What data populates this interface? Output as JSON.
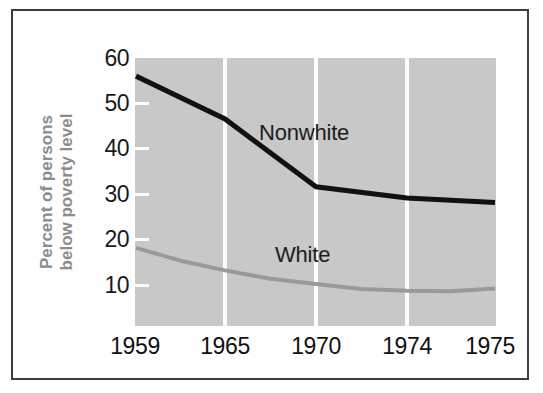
{
  "chart_data": {
    "type": "line",
    "title": "",
    "subtitle": "",
    "xlabel": "",
    "ylabel": "Percent of persons below poverty level",
    "ylabel_line1": "Percent of persons",
    "ylabel_line2": "below poverty level",
    "categories": [
      "1959",
      "1965",
      "1970",
      "1974",
      "1975"
    ],
    "x": [
      1959,
      1965,
      1970,
      1974,
      1975
    ],
    "xtick_labels": [
      "1959",
      "1965",
      "1970",
      "1974",
      "1975"
    ],
    "ytick_labels": [
      "10",
      "20",
      "30",
      "40",
      "50",
      "60"
    ],
    "yticks": [
      10,
      20,
      30,
      40,
      50,
      60
    ],
    "ylim": [
      0,
      60
    ],
    "xlim": [
      1959,
      1975
    ],
    "grid": "vertical-only",
    "gridline_color": "#ffffff",
    "plot_background": "#c9c9c9",
    "legend": "inline-annotations",
    "legend_position": "inside-plot",
    "series": [
      {
        "name": "Nonwhite",
        "color": "#111111",
        "line_width": 5,
        "values": [
          56,
          46.5,
          31.5,
          29,
          28
        ],
        "label_text": "Nonwhite"
      },
      {
        "name": "White",
        "color": "#9a9a9a",
        "line_width": 4,
        "values": [
          18,
          13,
          10,
          8.5,
          9
        ],
        "label_text": "White"
      }
    ],
    "annotations": [
      {
        "text": "Nonwhite",
        "series": "Nonwhite"
      },
      {
        "text": "White",
        "series": "White"
      }
    ]
  },
  "figure": {
    "border_color": "#3d3d3d",
    "background": "#ffffff",
    "axis_label_color": "#8d8d8d",
    "tick_label_color": "#111111"
  }
}
